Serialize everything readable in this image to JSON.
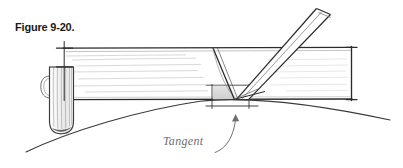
{
  "figure": {
    "caption": "Figure 9-20.",
    "background_color": "#ffffff",
    "ink_color": "#2b2b2b",
    "light_ink_color": "#8c8c8c",
    "shade_color": "#d9d9d9"
  },
  "annotations": {
    "tangent_label": "Tangent",
    "tangent_arrow": "curved-arrow-up-right",
    "pointer_target": "tangent-point"
  },
  "drawing": {
    "title": "Hand-drawn woodworking diagram: chisel held tangent to a curved workpiece",
    "elements": [
      {
        "name": "workpiece-board",
        "label": "board"
      },
      {
        "name": "round-tenon-end",
        "label": "rounded end"
      },
      {
        "name": "chisel-tool",
        "label": "chisel"
      },
      {
        "name": "tangent-curve",
        "label": "curve"
      },
      {
        "name": "cut-line",
        "label": "cut line"
      },
      {
        "name": "shaded-waste-block",
        "label": "waste"
      },
      {
        "name": "layout-tick-marks",
        "label": "layout marks"
      }
    ]
  }
}
